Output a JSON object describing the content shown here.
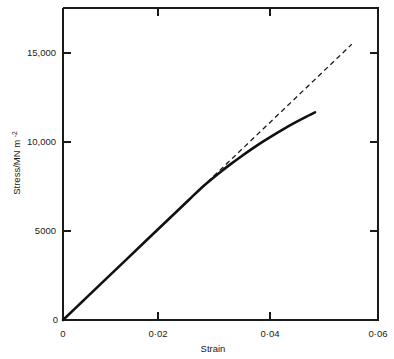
{
  "chart_data": {
    "type": "line",
    "title": "",
    "xlabel": "Strain",
    "ylabel": "Stress/MN m",
    "ylabel_superscript": "-2",
    "xlim": [
      0,
      0.06
    ],
    "ylim": [
      0,
      17430
    ],
    "grid": false,
    "legend": "none",
    "x_tick_labels": [
      "0",
      "0·02",
      "0·04",
      "0·06"
    ],
    "x_tick_values": [
      0,
      0.02,
      0.04,
      0.06
    ],
    "y_tick_labels": [
      "0",
      "5000",
      "10,000",
      "15,000"
    ],
    "y_tick_values": [
      0,
      5000,
      10000,
      15000
    ],
    "series": [
      {
        "name": "stress-strain-curve",
        "style": "solid",
        "color": "#111111",
        "x": [
          0,
          0.004,
          0.008,
          0.012,
          0.016,
          0.02,
          0.024,
          0.026,
          0.028,
          0.03,
          0.032,
          0.034,
          0.036,
          0.038,
          0.04,
          0.042,
          0.044,
          0.046,
          0.048
        ],
        "y": [
          0,
          1120,
          2240,
          3360,
          4480,
          5600,
          6720,
          7280,
          7790,
          8270,
          8720,
          9150,
          9560,
          9950,
          10320,
          10670,
          11000,
          11310,
          11600
        ]
      },
      {
        "name": "elastic-extrapolation",
        "style": "dashed",
        "color": "#1a1a1a",
        "x": [
          0.024,
          0.055
        ],
        "y": [
          6720,
          15400
        ]
      }
    ],
    "annotations": [
      {
        "name": "proportional-limit",
        "x": 0.026,
        "y": 7280,
        "note": "solid curve departs from the dashed linear extrapolation"
      }
    ]
  },
  "axes": {
    "x_axis_name": "strain-axis",
    "y_axis_name": "stress-axis",
    "origin_label": "0"
  }
}
